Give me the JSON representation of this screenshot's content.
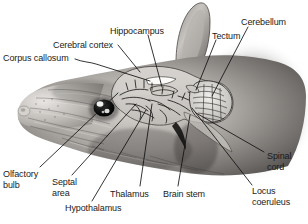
{
  "figure": {
    "background_color": "#ffffff",
    "text_color": "#1a1a1a",
    "leader_line_color": "#111111",
    "view": "lateral sagittal cutaway of rodent head showing brain in situ"
  },
  "labels": [
    {
      "id": "corpus-callosum",
      "text": "Corpus callosum",
      "x": 3,
      "y": 53,
      "align": "left"
    },
    {
      "id": "cerebral-cortex",
      "text": "Cerebral cortex",
      "x": 53,
      "y": 40,
      "align": "left"
    },
    {
      "id": "hippocampus",
      "text": "Hippocampus",
      "x": 110,
      "y": 26,
      "align": "left"
    },
    {
      "id": "tectum",
      "text": "Tectum",
      "x": 212,
      "y": 31,
      "align": "left"
    },
    {
      "id": "cerebellum",
      "text": "Cerebellum",
      "x": 241,
      "y": 17,
      "align": "left"
    },
    {
      "id": "spinal-cord",
      "text": "Spinal\ncord",
      "x": 267,
      "y": 151,
      "align": "left"
    },
    {
      "id": "locus-coeruleus",
      "text": "Locus\ncoeruleus",
      "x": 252,
      "y": 186,
      "align": "left"
    },
    {
      "id": "brain-stem",
      "text": "Brain stem",
      "x": 163,
      "y": 189,
      "align": "left"
    },
    {
      "id": "thalamus",
      "text": "Thalamus",
      "x": 110,
      "y": 189,
      "align": "left"
    },
    {
      "id": "hypothalamus",
      "text": "Hypothalamus",
      "x": 65,
      "y": 203,
      "align": "left"
    },
    {
      "id": "septal-area",
      "text": "Septal\narea",
      "x": 52,
      "y": 177,
      "align": "left"
    },
    {
      "id": "olfactory-bulb",
      "text": "Olfactory\nbulb",
      "x": 3,
      "y": 169,
      "align": "left"
    }
  ],
  "structures": [
    {
      "id": "ear",
      "name": "ear"
    },
    {
      "id": "eye",
      "name": "eye"
    },
    {
      "id": "snout",
      "name": "snout"
    },
    {
      "id": "neocortex",
      "name": "cerebral-cortex"
    },
    {
      "id": "cerebellum",
      "name": "cerebellum"
    },
    {
      "id": "brainstem",
      "name": "brain-stem"
    }
  ]
}
